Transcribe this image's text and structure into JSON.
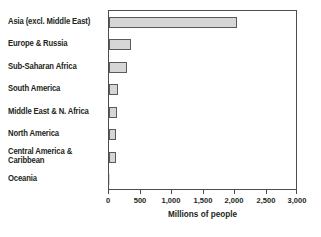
{
  "chart_data": {
    "type": "bar",
    "orientation": "horizontal",
    "title": "",
    "xlabel": "Millions of people",
    "ylabel": "",
    "xlim": [
      0,
      3000
    ],
    "xticks": [
      0,
      500,
      1000,
      1500,
      2000,
      2500,
      3000
    ],
    "xticklabels": [
      "0",
      "500",
      "1,000",
      "1,500",
      "2,000",
      "2,500",
      "3,000"
    ],
    "grid": false,
    "legend": null,
    "categories": [
      "Asia (excl. Middle East)",
      "Europe & Russia",
      "Sub-Saharan Africa",
      "South America",
      "Middle East & N. Africa",
      "North America",
      "Central America &\nCaribbean",
      "Oceania"
    ],
    "values": [
      2030,
      350,
      285,
      140,
      120,
      115,
      110,
      10
    ],
    "colors": {
      "bar_fill": "#d6d6d6",
      "bar_border": "#5a5a5a",
      "frame": "#4d4d4d",
      "text": "#231f20",
      "background": "#ffffff"
    }
  }
}
